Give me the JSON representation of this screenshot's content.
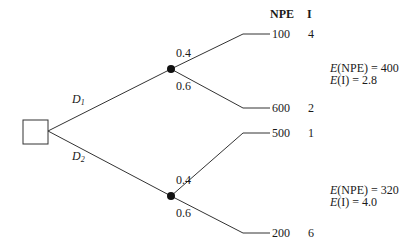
{
  "diagram": {
    "type": "decision-tree",
    "headers": {
      "npe": "NPE",
      "i": "I"
    },
    "decision_node": {
      "shape": "square"
    },
    "decisions": [
      {
        "label": "D",
        "subscript": "1",
        "chance_node": "filled-circle",
        "outcomes": [
          {
            "probability": "0.4",
            "npe": "100",
            "i": "4"
          },
          {
            "probability": "0.6",
            "npe": "600",
            "i": "2"
          }
        ],
        "expectations": {
          "e_npe_prefix": "E",
          "e_npe_text": "(NPE) = 400",
          "e_i_prefix": "E",
          "e_i_text": "(I) = 2.8"
        }
      },
      {
        "label": "D",
        "subscript": "2",
        "chance_node": "filled-circle",
        "outcomes": [
          {
            "probability": "0.4",
            "npe": "500",
            "i": "1"
          },
          {
            "probability": "0.6",
            "npe": "200",
            "i": "6"
          }
        ],
        "expectations": {
          "e_npe_prefix": "E",
          "e_npe_text": "(NPE) = 320",
          "e_i_prefix": "E",
          "e_i_text": "(I) = 4.0"
        }
      }
    ],
    "colors": {
      "line": "#333333",
      "node": "#111111",
      "text": "#1a1a1a"
    }
  }
}
